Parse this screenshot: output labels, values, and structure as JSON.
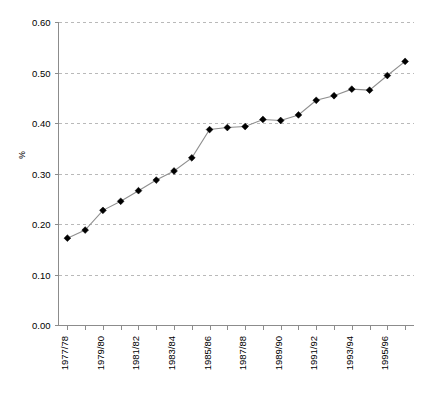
{
  "chart_data": {
    "type": "line",
    "title": "",
    "xlabel": "",
    "ylabel": "%",
    "ylim": [
      0.0,
      0.6
    ],
    "ytick_labels": [
      "0.00",
      "0.10",
      "0.20",
      "0.30",
      "0.40",
      "0.50",
      "0.60"
    ],
    "ytick_values": [
      0.0,
      0.1,
      0.2,
      0.3,
      0.4,
      0.5,
      0.6
    ],
    "grid": true,
    "legend": "none",
    "categories": [
      "1977/78",
      "1978/79",
      "1979/80",
      "1980/81",
      "1981/82",
      "1982/83",
      "1983/84",
      "1984/85",
      "1985/86",
      "1986/87",
      "1987/88",
      "1988/89",
      "1989/90",
      "1990/91",
      "1991/92",
      "1992/93",
      "1993/94",
      "1994/95",
      "1995/96",
      "1996/97"
    ],
    "xtick_labels_shown": [
      "1977/78",
      "1979/80",
      "1981/82",
      "1983/84",
      "1985/86",
      "1987/88",
      "1989/90",
      "1991/92",
      "1993/94",
      "1995/96"
    ],
    "values": [
      0.172,
      0.188,
      0.227,
      0.245,
      0.266,
      0.287,
      0.305,
      0.331,
      0.387,
      0.391,
      0.393,
      0.407,
      0.405,
      0.416,
      0.445,
      0.454,
      0.467,
      0.465,
      0.494,
      0.522
    ],
    "marker": "diamond",
    "colors": {
      "line": "#8f8f8f",
      "marker": "#000000",
      "grid": "#b9b9b9",
      "axis": "#8c8c8c",
      "background": "#ffffff"
    }
  }
}
